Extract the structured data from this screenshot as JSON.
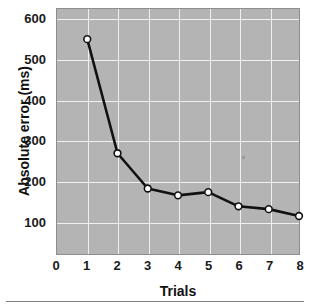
{
  "chart_data": {
    "type": "line",
    "title": "",
    "xlabel": "Trials",
    "ylabel": "Absolute error (ms)",
    "x": [
      1,
      2,
      3,
      4,
      5,
      6,
      7,
      8
    ],
    "values": [
      550,
      268,
      181,
      164,
      172,
      137,
      130,
      113
    ],
    "series": [
      {
        "name": "Absolute error",
        "values": [
          550,
          268,
          181,
          164,
          172,
          137,
          130,
          113
        ]
      }
    ],
    "xlim": [
      0,
      8
    ],
    "ylim": [
      0,
      600
    ],
    "xticks": [
      0,
      1,
      2,
      3,
      4,
      5,
      6,
      7,
      8
    ],
    "xtick_labels": [
      "0",
      "1",
      "2",
      "3",
      "4",
      "5",
      "6",
      "7",
      "8"
    ],
    "yticks": [
      100,
      200,
      300,
      400,
      500,
      600
    ],
    "ytick_labels": [
      "100",
      "200",
      "300",
      "400",
      "500",
      "600"
    ],
    "grid": true,
    "legend": null,
    "marker": "open-circle",
    "colors": {
      "panel_background": "#b4b4b4",
      "gridline": "#efefef",
      "line": "#111111",
      "marker_face": "#ffffff",
      "marker_edge": "#111111",
      "text": "#111111"
    }
  },
  "axes": {
    "y_title": "Absolute error (ms)",
    "x_title": "Trials",
    "y_tick_labels": [
      "600",
      "500",
      "400",
      "300",
      "200",
      "100"
    ],
    "x_tick_labels": [
      "0",
      "1",
      "2",
      "3",
      "4",
      "5",
      "6",
      "7",
      "8"
    ]
  }
}
